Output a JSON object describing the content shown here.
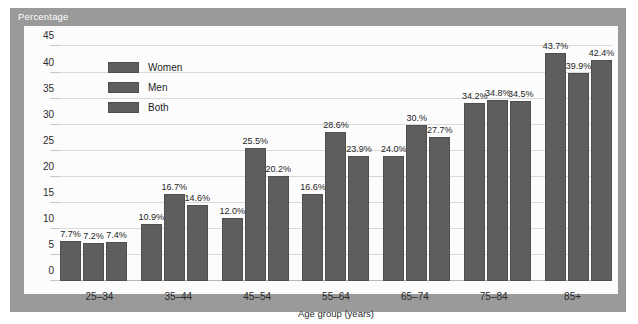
{
  "header": {
    "title": "Percentage"
  },
  "chart_data": {
    "type": "bar",
    "title": "Percentage",
    "xlabel": "Age group (years)",
    "ylabel": "",
    "ylim": [
      0,
      47
    ],
    "yticks": [
      0,
      5,
      10,
      15,
      20,
      25,
      30,
      35,
      40,
      45
    ],
    "grid": true,
    "legend_position": "top-left",
    "categories": [
      "25–34",
      "35–44",
      "45–54",
      "55–64",
      "65–74",
      "75–84",
      "85+"
    ],
    "series": [
      {
        "name": "Women",
        "color": "#5e5e5e",
        "values": [
          7.7,
          10.9,
          12.0,
          16.6,
          24.0,
          34.2,
          43.7
        ],
        "labels": [
          "7.7%",
          "10.9%",
          "12.0%",
          "16.6%",
          "24.0%",
          "34.2%",
          "43.7%"
        ]
      },
      {
        "name": "Men",
        "color": "#5e5e5e",
        "values": [
          7.2,
          16.7,
          25.5,
          28.6,
          30.0,
          34.8,
          39.9
        ],
        "labels": [
          "7.2%",
          "16.7%",
          "25.5%",
          "28.6%",
          "30.%",
          "34.8%",
          "39.9%"
        ]
      },
      {
        "name": "Both",
        "color": "#5e5e5e",
        "values": [
          7.4,
          14.6,
          20.2,
          23.9,
          27.7,
          34.5,
          42.4
        ],
        "labels": [
          "7.4%",
          "14.6%",
          "20.2%",
          "23.9%",
          "27.7%",
          "34.5%",
          "42.4%"
        ]
      }
    ]
  }
}
